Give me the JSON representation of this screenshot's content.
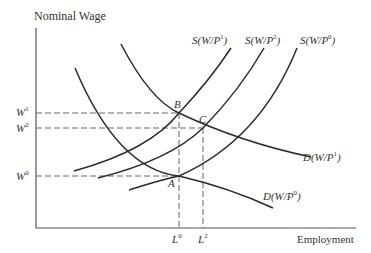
{
  "axes": {
    "y_label": "Nominal Wage",
    "x_label": "Employment"
  },
  "wage_levels": [
    {
      "name": "W",
      "sup": "1",
      "y": 113
    },
    {
      "name": "W",
      "sup": "2",
      "y": 128
    },
    {
      "name": "W",
      "sup": "0",
      "y": 176
    }
  ],
  "employment_levels": [
    {
      "name": "L",
      "sup": "0",
      "x": 179
    },
    {
      "name": "L",
      "sup": "2",
      "x": 203
    }
  ],
  "points": [
    {
      "label": "A",
      "x": 179,
      "y": 176
    },
    {
      "label": "B",
      "x": 179,
      "y": 113
    },
    {
      "label": "C",
      "x": 203,
      "y": 128
    }
  ],
  "curves": {
    "supply": [
      {
        "label_pre": "S(W/P",
        "sup": "1",
        "label_post": ")"
      },
      {
        "label_pre": "S(W/P",
        "sup": "2",
        "label_post": ")"
      },
      {
        "label_pre": "S(W/P",
        "sup": "0",
        "label_post": ")"
      }
    ],
    "demand": [
      {
        "label_pre": "D(W/P",
        "sup": "1",
        "label_post": ")"
      },
      {
        "label_pre": "D(W/P",
        "sup": "0",
        "label_post": ")"
      }
    ]
  },
  "colors": {
    "curve": "#2b2b2b",
    "axis": "#555555",
    "dashed": "#666666"
  }
}
